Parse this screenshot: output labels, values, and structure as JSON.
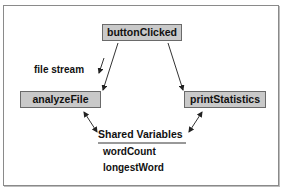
{
  "diagram": {
    "nodes": {
      "button_clicked": "buttonClicked",
      "analyze_file": "analyzeFile",
      "print_statistics": "printStatistics"
    },
    "edge_labels": {
      "file_stream": "file stream"
    },
    "shared": {
      "title": "Shared Variables",
      "variables": [
        "wordCount",
        "longestWord"
      ]
    },
    "colors": {
      "node_fill": "#c9c9c9",
      "node_border": "#6a6a6a",
      "frame_border": "#8a8a8a",
      "line": "#333333"
    }
  }
}
